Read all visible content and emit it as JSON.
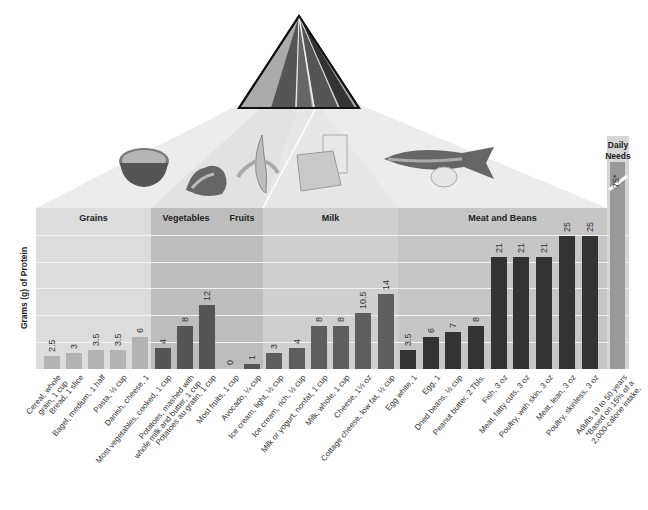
{
  "chart_data": {
    "type": "bar",
    "title": "",
    "ylabel": "Grams (g) of Protein",
    "xlabel": "",
    "ylim": [
      0,
      30
    ],
    "grid": true,
    "groups": [
      {
        "name": "Grains",
        "color": "#b3b3b3"
      },
      {
        "name": "Vegetables",
        "color": "#555555"
      },
      {
        "name": "Fruits",
        "color": "#555555"
      },
      {
        "name": "Milk",
        "color": "#5e5e5e"
      },
      {
        "name": "Meat and Beans",
        "color": "#333333"
      }
    ],
    "categories": [
      "Cereal, whole grain, 1 cup",
      "Bread, 1 slice",
      "Bagel, medium, 1 half",
      "Pasta, ½ cup",
      "Danish, cheese, 1",
      "Most vegetables, cooked, 1 cup",
      "Potatoes, mashed with whole milk and butter, 1 cup",
      "Potatoes au gratin, 1 cup",
      "Most fruits, 1 cup",
      "Avocado, ¼ cup",
      "Ice cream, light, ½ cup",
      "Ice cream, rich, ½ cup",
      "Milk or yogurt, nonfat, 1 cup",
      "Milk, whole, 1 cup",
      "Cheese, 1½ oz",
      "Cottage cheese, low fat, ½ cup",
      "Egg white, 1",
      "Egg, 1",
      "Dried beans, ½ cup",
      "Peanut butter, 2 Tbls.",
      "Fish, 3 oz",
      "Meat, fatty cuts, 3 oz",
      "Poultry, with skin, 3 oz",
      "Meat, lean, 3 oz",
      "Poultry, skinless, 3 oz",
      "Adults 19 to 50 years *Based on 15% of a 2,000-calorie intake."
    ],
    "series": [
      {
        "name": "Protein (g)",
        "values": [
          2.5,
          3,
          3.5,
          3.5,
          6,
          4,
          8,
          12,
          0,
          1,
          3,
          4,
          8,
          8,
          10.5,
          14,
          3.5,
          6,
          7,
          8,
          21,
          21,
          21,
          25,
          25,
          75
        ],
        "labels": [
          "2.5",
          "3",
          "3.5",
          "3.5",
          "6",
          "4",
          "8",
          "12",
          "0",
          "1",
          "3",
          "4",
          "8",
          "8",
          "10.5",
          "14",
          "3.5",
          "6",
          "7",
          "8",
          "21",
          "21",
          "21",
          "25",
          "25",
          "75*"
        ],
        "group_index": [
          0,
          0,
          0,
          0,
          0,
          1,
          1,
          1,
          2,
          2,
          3,
          3,
          3,
          3,
          3,
          3,
          4,
          4,
          4,
          4,
          4,
          4,
          4,
          4,
          4,
          5
        ]
      }
    ],
    "daily_needs": {
      "title": "Daily Needs",
      "value": 75,
      "label": "75*",
      "axis_break": true
    }
  },
  "labels": {
    "ylabel": "Grams (g) of Protein",
    "grains": "Grains",
    "vegetables": "Vegetables",
    "fruits": "Fruits",
    "milk": "Milk",
    "meat": "Meat and Beans",
    "daily_line1": "Daily",
    "daily_line2": "Needs"
  },
  "icons": {
    "pyramid": "food-pyramid-icon",
    "foods": [
      "cereal-bowl",
      "lettuce",
      "banana",
      "cheese-and-milk",
      "fish-and-egg"
    ]
  }
}
